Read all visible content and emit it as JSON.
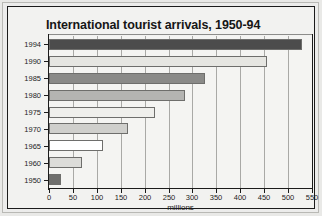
{
  "chart_data": {
    "type": "bar",
    "orientation": "horizontal",
    "title": "International tourist arrivals, 1950-94",
    "xlabel": "millions",
    "ylabel": "",
    "categories": [
      "1994",
      "1990",
      "1985",
      "1980",
      "1975",
      "1970",
      "1965",
      "1960",
      "1950"
    ],
    "values": [
      530,
      455,
      327,
      285,
      222,
      165,
      112,
      69,
      25
    ],
    "bar_colors": [
      "#4c4c4c",
      "#e6e6e2",
      "#8a8a88",
      "#b4b4b2",
      "#efefec",
      "#cfcfcc",
      "#ffffff",
      "#dcdcd9",
      "#6f6f6d"
    ],
    "xlim": [
      0,
      550
    ],
    "xticks": [
      0,
      50,
      100,
      150,
      200,
      250,
      300,
      350,
      400,
      450,
      500,
      550
    ],
    "xtick_labels": [
      "0",
      "50",
      "100",
      "150",
      "200",
      "250",
      "300",
      "350",
      "400",
      "450",
      "500",
      "550"
    ],
    "grid": true,
    "grid_axis": "x",
    "legend": false
  }
}
